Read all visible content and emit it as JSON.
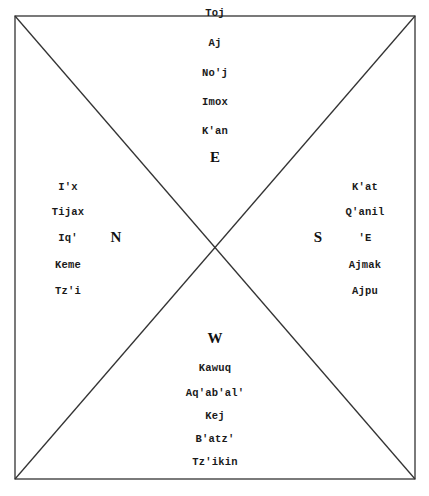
{
  "diagram": {
    "type": "cosmogram",
    "frame": {
      "x1": 15,
      "y1": 16,
      "x2": 415,
      "y2": 479,
      "stroke": "#333333"
    },
    "center": {
      "x": 215,
      "y": 248
    }
  },
  "east": {
    "direction_label": "E",
    "days": [
      "Toj",
      "Aj",
      "No'j",
      "Imox",
      "K'an"
    ]
  },
  "north": {
    "direction_label": "N",
    "days": [
      "I'x",
      "Tijax",
      "Iq'",
      "Keme",
      "Tz'i"
    ]
  },
  "south": {
    "direction_label": "S",
    "days": [
      "K'at",
      "Q'anil",
      "'E",
      "Ajmak",
      "Ajpu"
    ]
  },
  "west": {
    "direction_label": "W",
    "days": [
      "Kawuq",
      "Aq'ab'al'",
      "Kej",
      "B'atz'",
      "Tz'ikin"
    ]
  }
}
